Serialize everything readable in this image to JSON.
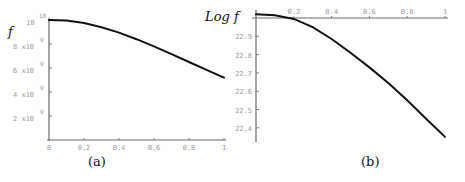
{
  "chart_data": [
    {
      "id": "a",
      "type": "line",
      "panel_label": "(a)",
      "title": "",
      "xlabel": "",
      "ylabel": "f",
      "xlim": [
        0,
        1
      ],
      "ylim": [
        0,
        10000000000
      ],
      "x_ticks": [
        "0",
        "0.2",
        "0.4",
        "0.6",
        "0.8",
        "1"
      ],
      "y_ticks": [
        {
          "mantissa": "2 x10",
          "exp": "9",
          "value": 2000000000
        },
        {
          "mantissa": "4 x10",
          "exp": "9",
          "value": 4000000000
        },
        {
          "mantissa": "6 x10",
          "exp": "9",
          "value": 6000000000
        },
        {
          "mantissa": "8 x10",
          "exp": "9",
          "value": 8000000000
        },
        {
          "mantissa": "10",
          "exp": "10",
          "value": 10000000000
        }
      ],
      "grid": false,
      "series": [
        {
          "name": "f",
          "x": [
            0,
            0.1,
            0.2,
            0.3,
            0.4,
            0.5,
            0.6,
            0.7,
            0.8,
            0.9,
            1.0
          ],
          "y": [
            10000000000,
            9950000000,
            9750000000,
            9400000000,
            8950000000,
            8400000000,
            7800000000,
            7150000000,
            6500000000,
            5850000000,
            5200000000
          ]
        }
      ]
    },
    {
      "id": "b",
      "type": "line",
      "panel_label": "(b)",
      "title": "",
      "xlabel": "",
      "ylabel": "Log f",
      "xlim": [
        0,
        1
      ],
      "ylim": [
        22.32,
        23.0
      ],
      "x_ticks": [
        "0.2",
        "0.4",
        "0.6",
        "0.8",
        "1"
      ],
      "y_ticks": [
        "22.9",
        "22.8",
        "22.7",
        "22.6",
        "22.5",
        "22.4"
      ],
      "grid": false,
      "series": [
        {
          "name": "Log f",
          "x": [
            0,
            0.1,
            0.2,
            0.3,
            0.4,
            0.5,
            0.6,
            0.7,
            0.8,
            0.9,
            1.0
          ],
          "y": [
            23.02,
            23.015,
            22.995,
            22.95,
            22.885,
            22.81,
            22.73,
            22.645,
            22.55,
            22.45,
            22.35
          ]
        }
      ]
    }
  ]
}
